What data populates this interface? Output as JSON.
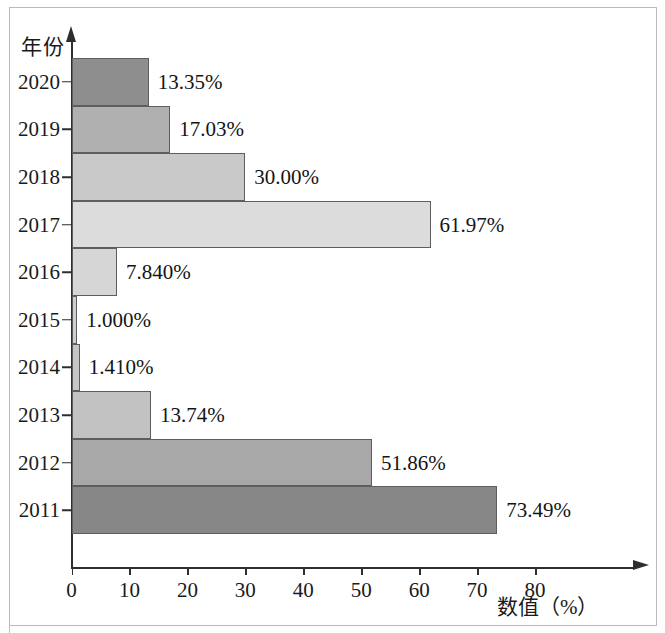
{
  "chart_data": {
    "type": "bar",
    "orientation": "horizontal",
    "title": "",
    "xlabel": "数值（%）",
    "ylabel": "年份",
    "categories": [
      "2020",
      "2019",
      "2018",
      "2017",
      "2016",
      "2015",
      "2014",
      "2013",
      "2012",
      "2011"
    ],
    "values": [
      13.35,
      17.03,
      30.0,
      61.97,
      7.84,
      1.0,
      1.41,
      13.74,
      51.86,
      73.49
    ],
    "value_labels": [
      "13.35%",
      "17.03%",
      "30.00%",
      "61.97%",
      "7.840%",
      "1.000%",
      "1.410%",
      "13.74%",
      "51.86%",
      "73.49%"
    ],
    "bar_colors": [
      "#8e8e8e",
      "#b0b0b0",
      "#c9c9c9",
      "#dcdcdc",
      "#d6d6d6",
      "#cfcfcf",
      "#c6c6c6",
      "#c2c2c2",
      "#a8a8a8",
      "#878787"
    ],
    "xlim": [
      0,
      80
    ],
    "xticks": [
      0,
      10,
      20,
      30,
      40,
      50,
      60,
      70,
      80
    ],
    "xtick_labels": [
      "0",
      "10",
      "20",
      "30",
      "40",
      "50",
      "60",
      "70",
      "80"
    ],
    "grid": false,
    "legend": false
  },
  "axis": {
    "y_title": "年份",
    "x_title": "数值（%）"
  }
}
